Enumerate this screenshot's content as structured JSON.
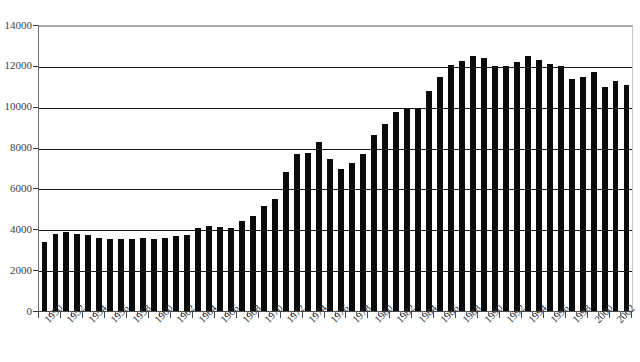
{
  "title": "",
  "chart_data": {
    "type": "bar",
    "title": "",
    "subtitle": "",
    "xlabel": "",
    "ylabel": "",
    "ylim": [
      0,
      14000
    ],
    "ytick_step": 2000,
    "yticks": [
      0,
      2000,
      4000,
      6000,
      8000,
      10000,
      12000,
      14000
    ],
    "ytick_labels": [
      "0",
      "2000",
      "4000",
      "6000",
      "8000",
      "10000",
      "12000",
      "14000"
    ],
    "grid": true,
    "grid_axis": "y",
    "legend": false,
    "legend_position": "none",
    "bar_color": "#0b0b0b",
    "xtick_label_rotation": -45,
    "xtick_label_interval": 2,
    "categories": [
      "1950",
      "1951",
      "1952",
      "1953",
      "1954",
      "1955",
      "1956",
      "1957",
      "1958",
      "1959",
      "1960",
      "1961",
      "1962",
      "1963",
      "1964",
      "1965",
      "1966",
      "1967",
      "1968",
      "1969",
      "1970",
      "1971",
      "1972",
      "1973",
      "1974",
      "1975",
      "1976",
      "1977",
      "1978",
      "1979",
      "1980",
      "1981",
      "1982",
      "1983",
      "1984",
      "1985",
      "1986",
      "1987",
      "1988",
      "1989",
      "1990",
      "1991",
      "1992",
      "1993",
      "1994",
      "1995",
      "1996",
      "1997",
      "1998",
      "1999",
      "2000",
      "2001",
      "2002",
      "2003"
    ],
    "xtick_labels": [
      "1950",
      "1952",
      "1954",
      "1956",
      "1958",
      "1960",
      "1962",
      "1964",
      "1966",
      "1968",
      "1970",
      "1972",
      "1974",
      "1976",
      "1978",
      "1980",
      "1982",
      "1984",
      "1986",
      "1988",
      "1990",
      "1992",
      "1994",
      "1996",
      "1998",
      "2000",
      "2002"
    ],
    "values": [
      3450,
      3800,
      3900,
      3800,
      3750,
      3600,
      3550,
      3580,
      3560,
      3600,
      3550,
      3600,
      3700,
      3750,
      4100,
      4200,
      4150,
      4100,
      4450,
      4700,
      5200,
      5550,
      6850,
      7750,
      7800,
      8300,
      7500,
      7000,
      7300,
      7750,
      8650,
      9200,
      9800,
      9950,
      9950,
      10800,
      11500,
      12100,
      12300,
      12550,
      12450,
      12050,
      12050,
      12250,
      12550,
      12350,
      12150,
      12050,
      11400,
      11500,
      11750,
      11000,
      11300,
      11100
    ]
  }
}
